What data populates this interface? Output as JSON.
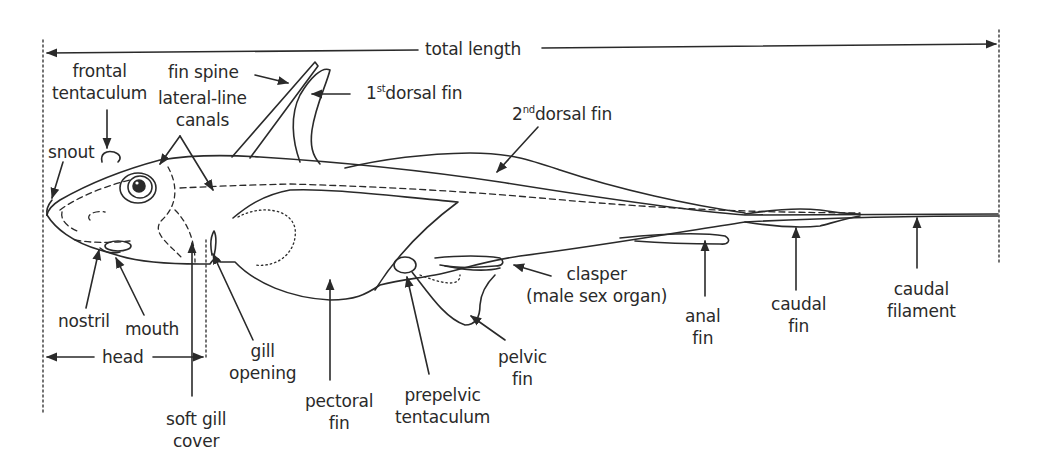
{
  "diagram": {
    "colors": {
      "line": "#2a2a2a",
      "background": "#ffffff"
    },
    "measurements": {
      "total_length": "total length",
      "head": "head"
    },
    "labels": {
      "frontal_tentaculum": [
        "frontal",
        "tentaculum"
      ],
      "fin_spine": "fin spine",
      "lateral_line_canals": [
        "lateral-line",
        "canals"
      ],
      "first_dorsal_fin": {
        "num": "1",
        "sup": "st",
        "text": "dorsal fin"
      },
      "second_dorsal_fin": {
        "num": "2",
        "sup": "nd",
        "text": "dorsal fin"
      },
      "snout": "snout",
      "nostril": "nostril",
      "mouth": "mouth",
      "soft_gill_cover": [
        "soft gill",
        "cover"
      ],
      "gill_opening": [
        "gill",
        "opening"
      ],
      "pectoral_fin": [
        "pectoral",
        "fin"
      ],
      "prepelvic_tentaculum": [
        "prepelvic",
        "tentaculum"
      ],
      "pelvic_fin": [
        "pelvic",
        "fin"
      ],
      "clasper": [
        "clasper",
        "(male sex organ)"
      ],
      "anal_fin": [
        "anal",
        "fin"
      ],
      "caudal_fin": [
        "caudal",
        "fin"
      ],
      "caudal_filament": [
        "caudal",
        "filament"
      ]
    }
  }
}
